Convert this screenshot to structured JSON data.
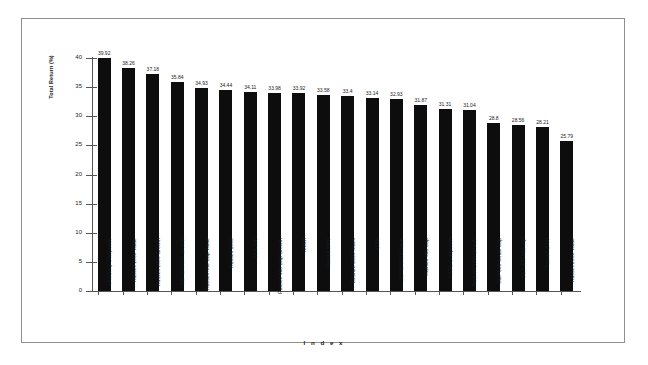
{
  "chart_data": {
    "type": "bar",
    "title": "",
    "xlabel": "I n d e x",
    "ylabel": "Total Return (%)",
    "ylim": [
      0,
      40
    ],
    "yticks": [
      40,
      35,
      30,
      25,
      20,
      15,
      10,
      5,
      0
    ],
    "grid": false,
    "legend": null,
    "bar_color": "#0d0d0d",
    "categories": [
      "NASDAQ Composite",
      "Russell 1000 Value",
      "Russell 1000 Growth",
      "S&P/BARRA Growth",
      "Russell Mid Cap Value",
      "Russell 1000",
      "S&P 500",
      "Russell Mid Cap Growth",
      "AMWI",
      "Russell 3000",
      "Wilshire 5000 Index",
      "DJIA",
      "S&P/BARRA Value",
      "Russell Mid Cap",
      "NYSE Composite",
      "Russell 2000 Growth",
      "S&P 600 Small Cap",
      "S&P 400 Mid-cap",
      "Russell 2000",
      "Russell 2000 Value"
    ],
    "values": [
      39.92,
      38.26,
      37.18,
      35.84,
      34.93,
      34.44,
      34.11,
      33.98,
      33.92,
      33.58,
      33.4,
      33.14,
      32.93,
      31.87,
      31.31,
      31.04,
      28.8,
      28.56,
      28.21,
      25.79
    ],
    "value_labels": [
      "39.92",
      "38.26",
      "37.18",
      "35.84",
      "34.93",
      "34.44",
      "34.11",
      "33.98",
      "33.92",
      "33.58",
      "33.4",
      "33.14",
      "32.93",
      "31.87",
      "31.31",
      "31.04",
      "28.8",
      "28.56",
      "28.21",
      "25.79"
    ]
  }
}
